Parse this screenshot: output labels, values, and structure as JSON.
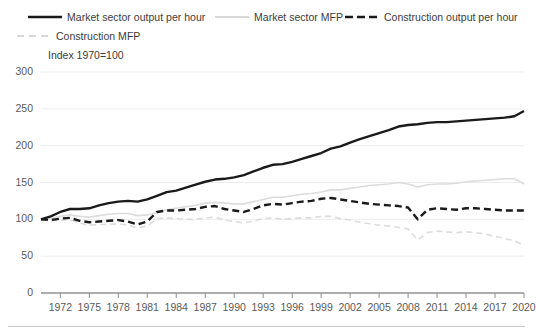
{
  "legend": {
    "items": [
      {
        "label": "Market sector output per hour",
        "style": "solid-thick-dark",
        "color": "#1a1a1a",
        "icon": "line-swatch-solid-dark-icon"
      },
      {
        "label": "Market sector MFP",
        "style": "solid-thin-light",
        "color": "#d5d5d5",
        "icon": "line-swatch-solid-light-icon"
      },
      {
        "label": "Construction output per hour",
        "style": "dashed-thick-dark",
        "color": "#1a1a1a",
        "icon": "line-swatch-dashed-dark-icon"
      },
      {
        "label": "Construction MFP",
        "style": "dashed-thin-light",
        "color": "#d5d5d5",
        "icon": "line-swatch-dashed-light-icon"
      }
    ]
  },
  "axis_note": "Index 1970=100",
  "chart_data": {
    "type": "line",
    "title": "",
    "subtitle": "",
    "xlabel": "",
    "ylabel": "Index 1970=100",
    "ylim": [
      0,
      300
    ],
    "yticks": [
      0,
      50,
      100,
      150,
      200,
      250,
      300
    ],
    "ytick_labels": [
      "0",
      "50",
      "100",
      "150",
      "200",
      "250",
      "300"
    ],
    "xlim": [
      1970,
      2020
    ],
    "xticks": [
      1972,
      1975,
      1978,
      1981,
      1984,
      1987,
      1990,
      1993,
      1996,
      1999,
      2002,
      2005,
      2008,
      2011,
      2014,
      2017,
      2020
    ],
    "xtick_labels": [
      "1972",
      "1975",
      "1978",
      "1981",
      "1984",
      "1987",
      "1990",
      "1993",
      "1996",
      "1999",
      "2002",
      "2005",
      "2008",
      "2011",
      "2014",
      "2017",
      "2020"
    ],
    "grid": true,
    "grid_axis": "y",
    "legend_position": "top",
    "x": [
      1970,
      1971,
      1972,
      1973,
      1974,
      1975,
      1976,
      1977,
      1978,
      1979,
      1980,
      1981,
      1982,
      1983,
      1984,
      1985,
      1986,
      1987,
      1988,
      1989,
      1990,
      1991,
      1992,
      1993,
      1994,
      1995,
      1996,
      1997,
      1998,
      1999,
      2000,
      2001,
      2002,
      2003,
      2004,
      2005,
      2006,
      2007,
      2008,
      2009,
      2010,
      2011,
      2012,
      2013,
      2014,
      2015,
      2016,
      2017,
      2018,
      2019,
      2020
    ],
    "series": [
      {
        "name": "Market sector output per hour",
        "color": "#1a1a1a",
        "style": "solid",
        "width": 2.4,
        "values": [
          100,
          104,
          110,
          114,
          114,
          115,
          119,
          122,
          124,
          125,
          124,
          127,
          132,
          137,
          139,
          143,
          147,
          151,
          154,
          155,
          157,
          160,
          165,
          170,
          174,
          175,
          178,
          182,
          186,
          190,
          196,
          199,
          204,
          209,
          213,
          217,
          221,
          226,
          228,
          229,
          231,
          232,
          232,
          233,
          234,
          235,
          236,
          237,
          238,
          240,
          247
        ]
      },
      {
        "name": "Market sector MFP",
        "color": "#dcdcdc",
        "style": "solid",
        "width": 1.6,
        "values": [
          100,
          101,
          104,
          106,
          104,
          103,
          105,
          107,
          108,
          108,
          105,
          106,
          109,
          113,
          115,
          117,
          119,
          122,
          123,
          122,
          121,
          121,
          124,
          127,
          130,
          130,
          132,
          134,
          135,
          137,
          140,
          140,
          142,
          144,
          146,
          147,
          148,
          150,
          148,
          144,
          147,
          148,
          148,
          149,
          151,
          152,
          153,
          154,
          155,
          155,
          148
        ]
      },
      {
        "name": "Construction output per hour",
        "color": "#1a1a1a",
        "style": "dashed",
        "width": 2.4,
        "values": [
          100,
          99,
          101,
          102,
          98,
          96,
          97,
          98,
          99,
          97,
          93,
          97,
          110,
          112,
          112,
          113,
          114,
          117,
          118,
          114,
          112,
          110,
          114,
          119,
          121,
          120,
          122,
          124,
          125,
          128,
          129,
          127,
          125,
          123,
          121,
          120,
          119,
          118,
          116,
          100,
          113,
          115,
          114,
          113,
          115,
          115,
          114,
          113,
          112,
          112,
          112
        ]
      },
      {
        "name": "Construction MFP",
        "color": "#dcdcdc",
        "style": "dashed",
        "width": 1.6,
        "values": [
          100,
          98,
          99,
          99,
          95,
          92,
          93,
          93,
          94,
          92,
          88,
          91,
          101,
          102,
          101,
          100,
          100,
          102,
          103,
          99,
          97,
          95,
          98,
          101,
          102,
          100,
          101,
          102,
          102,
          104,
          104,
          101,
          99,
          96,
          94,
          92,
          91,
          89,
          87,
          72,
          82,
          84,
          83,
          82,
          83,
          82,
          80,
          77,
          74,
          71,
          65
        ]
      }
    ]
  }
}
